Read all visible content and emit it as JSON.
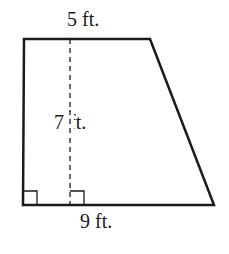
{
  "diagram": {
    "type": "trapezoid",
    "labels": {
      "top_base": "5 ft.",
      "height": "7 ft.",
      "bottom_base": "9 ft."
    },
    "measurements": {
      "top_base_ft": 5,
      "height_ft": 7,
      "bottom_base_ft": 9
    },
    "right_angle_markers": 2,
    "stroke_color": "#1a1a1a"
  }
}
